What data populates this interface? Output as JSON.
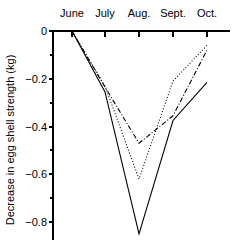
{
  "chart_data": {
    "type": "line",
    "title": "",
    "subtitle": "",
    "xlabel": "",
    "ylabel": "Decrease in egg shell strength (kg)",
    "categories": [
      "June",
      "July",
      "Aug.",
      "Sept.",
      "Oct."
    ],
    "x_tick_labels": [
      "June",
      "July",
      "Aug.",
      "Sept.",
      "Oct."
    ],
    "y_tick_labels": [
      "0",
      "−0.2",
      "−0.4",
      "−0.6",
      "−0.8"
    ],
    "y_tick_values": [
      0,
      -0.2,
      -0.4,
      -0.6,
      -0.8
    ],
    "ylim": [
      -0.88,
      0.02
    ],
    "xlim": [
      0,
      4
    ],
    "grid": false,
    "legend": "none",
    "x_axis_position": "top",
    "series": [
      {
        "name": "series-dotted",
        "style": "dotted",
        "values": [
          0.0,
          -0.23,
          -0.62,
          -0.21,
          -0.06
        ]
      },
      {
        "name": "series-dashdot",
        "style": "dash-dot",
        "values": [
          0.0,
          -0.235,
          -0.47,
          -0.355,
          -0.08
        ]
      },
      {
        "name": "series-solid",
        "style": "solid",
        "values": [
          0.0,
          -0.255,
          -0.85,
          -0.375,
          -0.215
        ]
      }
    ],
    "annotations": []
  },
  "colors": {
    "axis": "#000000",
    "line": "#000000",
    "background": "#ffffff"
  }
}
